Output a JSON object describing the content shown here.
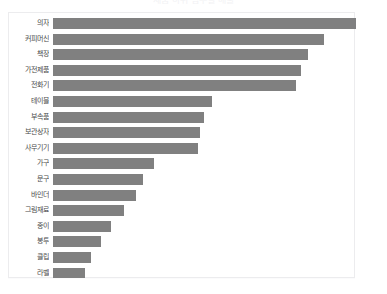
{
  "chart_data": {
    "type": "bar",
    "orientation": "horizontal",
    "title": "제품 하위 범주별 매출",
    "xlabel": "",
    "ylabel": "",
    "grid": false,
    "legend": false,
    "bar_color": "#808080",
    "xlim": [
      0,
      263
    ],
    "categories": [
      "의자",
      "커피머신",
      "책장",
      "가전제품",
      "전화기",
      "테이블",
      "부속품",
      "보관상자",
      "사무기기",
      "가구",
      "문구",
      "바인더",
      "그림재료",
      "종이",
      "봉투",
      "클립",
      "라벨"
    ],
    "values": [
      263,
      235,
      221,
      215,
      211,
      138,
      131,
      128,
      126,
      88,
      78,
      72,
      62,
      50,
      42,
      33,
      28
    ]
  },
  "plot": {
    "background": "#ffffff",
    "border_color": "#ececee"
  }
}
